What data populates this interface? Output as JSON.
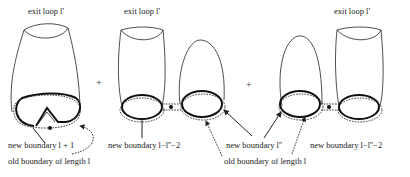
{
  "labels": {
    "exit_loop_1": "exit loop l'",
    "exit_loop_2": "exit loop l'",
    "exit_loop_3": "exit loop l'",
    "plus_1": "+",
    "plus_2": "+",
    "new_boundary_a": "new boundary l + 1",
    "new_boundary_b": "new boundary l−l''−2",
    "new_boundary_c": "new boundary  l''",
    "new_boundary_d": "new boundary l−l''−2",
    "old_boundary_1": "old boundary of length l",
    "old_boundary_2": "old boundary of length l"
  },
  "colors": {
    "stroke": "#222222",
    "background": "#ffffff"
  }
}
